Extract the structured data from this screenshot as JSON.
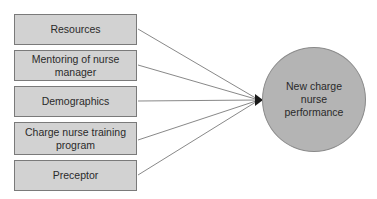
{
  "diagram": {
    "factors": [
      {
        "label": "Resources"
      },
      {
        "label": "Mentoring of nurse manager"
      },
      {
        "label": "Demographics"
      },
      {
        "label": "Charge nurse training program"
      },
      {
        "label": "Preceptor"
      }
    ],
    "outcome": {
      "label": "New charge nurse performance"
    },
    "colors": {
      "box_fill": "#d2d2d2",
      "circle_fill": "#b4b4b4",
      "line": "#6a6a6a"
    }
  }
}
